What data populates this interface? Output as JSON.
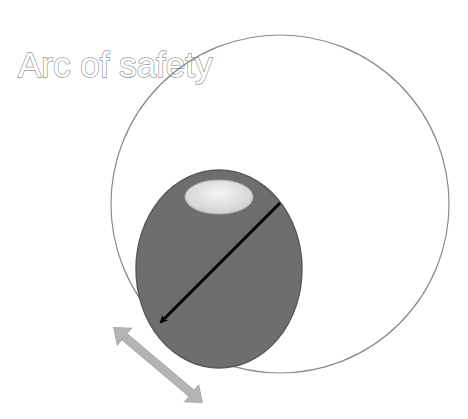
{
  "title": "Arc of safety",
  "colors": {
    "background": "#ffffff",
    "arc_circle_stroke": "#8a8a8a",
    "head_fill": "#6e6e6e",
    "head_stroke": "#5a5a5a",
    "highlight_fill": "#e8e8e8",
    "radius_arrow": "#000000",
    "movement_arrow": "#b4b4b4",
    "title_outline": "#9a9a9a"
  },
  "shapes": {
    "arc_circle": "circle",
    "head": "ellipse",
    "highlight": "ellipse",
    "radius_arrow": "single-headed-arrow",
    "movement_arrow": "double-headed-arrow"
  }
}
